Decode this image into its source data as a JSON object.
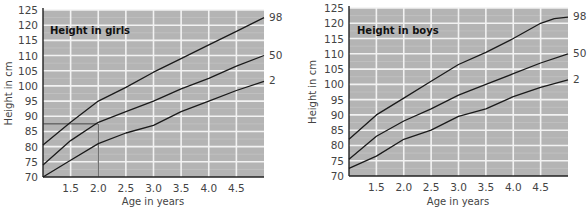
{
  "chart_data": [
    {
      "type": "line",
      "title": "Height in girls",
      "xlabel": "Age in years",
      "ylabel": "Height in cm",
      "xlim": [
        1.0,
        5.0
      ],
      "ylim": [
        70,
        125
      ],
      "x_ticks": [
        "1.5",
        "2.0",
        "2.5",
        "3.0",
        "3.5",
        "4.0",
        "4.5"
      ],
      "x_tick_values": [
        1.5,
        2.0,
        2.5,
        3.0,
        3.5,
        4.0,
        4.5
      ],
      "y_ticks": [
        "70",
        "75",
        "80",
        "85",
        "90",
        "95",
        "100",
        "105",
        "110",
        "115",
        "120",
        "125"
      ],
      "y_tick_values": [
        70,
        75,
        80,
        85,
        90,
        95,
        100,
        105,
        110,
        115,
        120,
        125
      ],
      "grid": true,
      "background": "#b4b4b4",
      "series": [
        {
          "name": "98",
          "x": [
            1.0,
            1.5,
            2.0,
            2.5,
            3.0,
            3.5,
            4.0,
            4.5,
            5.0
          ],
          "values": [
            80.5,
            88,
            95,
            99.5,
            104.5,
            109,
            113.5,
            118,
            122.5
          ]
        },
        {
          "name": "50",
          "x": [
            1.0,
            1.5,
            2.0,
            2.5,
            3.0,
            3.5,
            4.0,
            4.5,
            5.0
          ],
          "values": [
            74,
            82,
            88,
            91.5,
            95,
            99,
            102.5,
            106.5,
            110
          ]
        },
        {
          "name": "2",
          "x": [
            1.0,
            1.5,
            2.0,
            2.5,
            3.0,
            3.5,
            4.0,
            4.5,
            5.0
          ],
          "values": [
            70,
            75.5,
            81,
            84.5,
            87,
            91.5,
            95,
            98.5,
            101.5
          ]
        }
      ],
      "annotations": [
        {
          "type": "reference-lines",
          "x": 2.0,
          "y": 87.5
        }
      ]
    },
    {
      "type": "line",
      "title": "Height in boys",
      "xlabel": "Age in years",
      "ylabel": "Height in cm",
      "xlim": [
        1.0,
        5.0
      ],
      "ylim": [
        70,
        125
      ],
      "x_ticks": [
        "1.5",
        "2.0",
        "2.5",
        "3.0",
        "3.5",
        "4.0",
        "4.5"
      ],
      "x_tick_values": [
        1.5,
        2.0,
        2.5,
        3.0,
        3.5,
        4.0,
        4.5
      ],
      "y_ticks": [
        "70",
        "75",
        "80",
        "85",
        "90",
        "95",
        "100",
        "105",
        "110",
        "115",
        "120",
        "125"
      ],
      "y_tick_values": [
        70,
        75,
        80,
        85,
        90,
        95,
        100,
        105,
        110,
        115,
        120,
        125
      ],
      "grid": true,
      "background": "#b4b4b4",
      "series": [
        {
          "name": "98",
          "x": [
            1.0,
            1.5,
            2.0,
            2.5,
            3.0,
            3.5,
            4.0,
            4.5,
            4.75,
            5.0
          ],
          "values": [
            82,
            90,
            95.5,
            101,
            106.5,
            110.5,
            115,
            120,
            121.5,
            122
          ]
        },
        {
          "name": "50",
          "x": [
            1.0,
            1.5,
            2.0,
            2.5,
            3.0,
            3.5,
            4.0,
            4.5,
            5.0
          ],
          "values": [
            75.5,
            83,
            88,
            92,
            96.5,
            100,
            103.5,
            107,
            110
          ]
        },
        {
          "name": "2",
          "x": [
            1.0,
            1.5,
            2.0,
            2.5,
            3.0,
            3.5,
            4.0,
            4.5,
            5.0
          ],
          "values": [
            72.5,
            76.5,
            82,
            85,
            89.5,
            92,
            96,
            99,
            101.5
          ]
        }
      ],
      "annotations": []
    }
  ]
}
